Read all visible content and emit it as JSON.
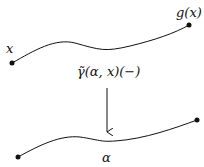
{
  "diagram": {
    "labels": {
      "top_start": "x",
      "top_end": "g(x)",
      "arrow": "γ̃(α, x)(−)",
      "bottom": "α"
    },
    "colors": {
      "stroke": "#111111",
      "background": "#ffffff"
    }
  }
}
